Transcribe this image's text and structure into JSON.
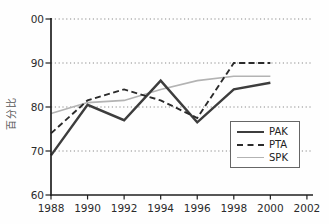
{
  "chart_data": {
    "type": "line",
    "title": "",
    "xlabel": "",
    "ylabel": "百分比",
    "x": [
      1988,
      1990,
      1992,
      1994,
      1996,
      1998,
      2000
    ],
    "x_tick_labels": [
      "1988",
      "1990",
      "1992",
      "1994",
      "1996",
      "1998",
      "2000",
      "2002"
    ],
    "x_ticks": [
      1988,
      1990,
      1992,
      1994,
      1996,
      1998,
      2000,
      2002
    ],
    "y_ticks": [
      60,
      70,
      80,
      90,
      100
    ],
    "y_tick_labels": [
      "60",
      "70",
      "80",
      "90",
      "00"
    ],
    "ylim": [
      60,
      100
    ],
    "xlim": [
      1988,
      2002
    ],
    "grid": "horizontal dotted gridlines at 70, 80, 90, 100",
    "legend_position": "inside lower right",
    "axis_color": "#1f1f1f",
    "gridline_color": "#8a8a8a",
    "series": [
      {
        "name": "PAK",
        "style": "solid thick",
        "color": "#3d3d3d",
        "values": [
          69,
          80.5,
          77,
          86,
          76.5,
          84,
          85.5
        ]
      },
      {
        "name": "PTA",
        "style": "dashed",
        "color": "#2b2b2b",
        "values": [
          74,
          81.5,
          84,
          81.5,
          77.5,
          90,
          90
        ]
      },
      {
        "name": "SPK",
        "style": "solid thin",
        "color": "#b3b3b3",
        "values": [
          78.5,
          81,
          81.5,
          84,
          86,
          87,
          87
        ]
      }
    ]
  }
}
